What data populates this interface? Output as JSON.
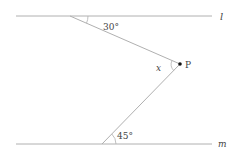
{
  "diagram": {
    "lines": {
      "l": {
        "label": "l"
      },
      "m": {
        "label": "m"
      }
    },
    "point": {
      "label": "P"
    },
    "angles": {
      "top": "30°",
      "bottom": "45°",
      "unknown": "x"
    },
    "colors": {
      "line": "#b0b0b0",
      "point": "#111111",
      "text": "#444444"
    }
  }
}
